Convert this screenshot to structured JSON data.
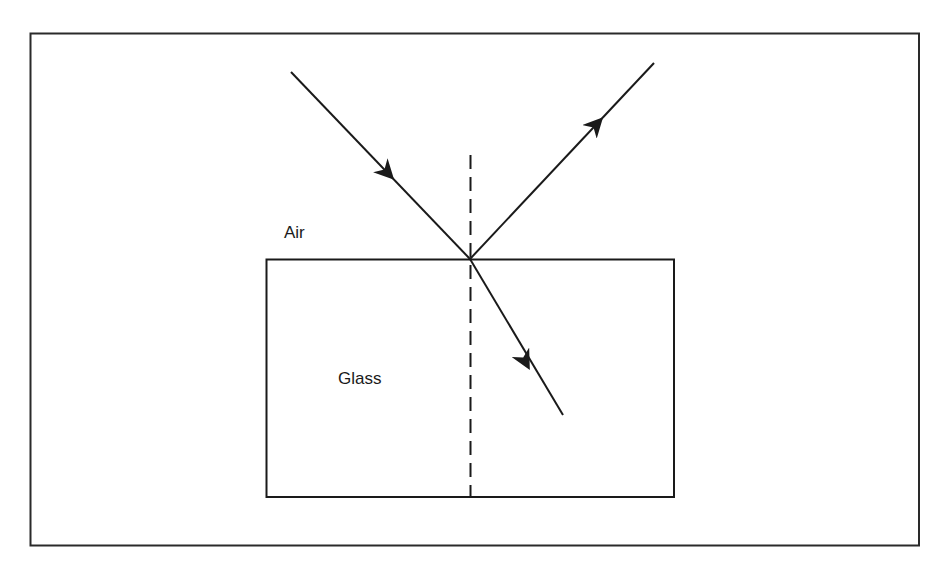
{
  "diagram": {
    "labels": {
      "air": "Air",
      "glass": "Glass"
    },
    "colors": {
      "line": "#1a1a1a",
      "frame": "#2a2a2a",
      "background": "#ffffff"
    },
    "elements": {
      "frame": {
        "x": 30,
        "y": 33,
        "width": 889,
        "height": 513
      },
      "glass_block": {
        "x": 266,
        "y": 259,
        "width": 408,
        "height": 238
      },
      "point_of_incidence": {
        "x": 470,
        "y": 259
      },
      "normal_line": {
        "x": 470,
        "y_start": 155,
        "y_end": 497,
        "style": "dashed"
      },
      "incident_ray": {
        "from": [
          291,
          72
        ],
        "to": [
          470,
          259
        ],
        "arrow_at": [
          384,
          172
        ],
        "direction": "toward-interface"
      },
      "reflected_ray": {
        "from": [
          470,
          259
        ],
        "to": [
          654,
          63
        ],
        "arrow_at": [
          594,
          127
        ],
        "direction": "away-from-interface"
      },
      "refracted_ray": {
        "from": [
          470,
          259
        ],
        "to": [
          563,
          415
        ],
        "arrow_at": [
          524,
          358
        ],
        "direction": "into-glass"
      }
    }
  }
}
